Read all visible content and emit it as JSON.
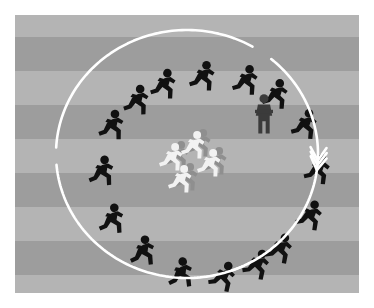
{
  "image": {
    "title": "Group of pictogram runners circling a small inner group",
    "canvas": {
      "width": 374,
      "height": 308,
      "background": "#ffffff"
    },
    "field": {
      "x": 15,
      "y": 15,
      "width": 344,
      "height": 278
    }
  },
  "colors": {
    "page_background": "#ffffff",
    "stripe_light": "#b4b4b4",
    "stripe_dark": "#9d9d9d",
    "runner_outer": "#111111",
    "observer": "#3b3b3b",
    "runner_inner": "#f2f2f2",
    "inner_shadow": "#8f8f8f",
    "arrow": "#ffffff"
  },
  "background": {
    "name": "horizontal-stripe-bands",
    "stripe_height": 34,
    "bands": [
      {
        "top": 0,
        "height": 22,
        "tone": "light"
      },
      {
        "top": 22,
        "height": 34,
        "tone": "dark"
      },
      {
        "top": 56,
        "height": 34,
        "tone": "light"
      },
      {
        "top": 90,
        "height": 34,
        "tone": "dark"
      },
      {
        "top": 124,
        "height": 34,
        "tone": "light"
      },
      {
        "top": 158,
        "height": 34,
        "tone": "dark"
      },
      {
        "top": 192,
        "height": 34,
        "tone": "light"
      },
      {
        "top": 226,
        "height": 34,
        "tone": "dark"
      },
      {
        "top": 260,
        "height": 18,
        "tone": "light"
      }
    ]
  },
  "circle": {
    "name": "rotation-ring",
    "center_x": 172,
    "center_y": 139,
    "radius_x": 131,
    "radius_y": 124,
    "stroke_width": 2.6,
    "arrow_count": 3,
    "arrow_directions": [
      "down-right",
      "up",
      "left"
    ]
  },
  "outer_runners": {
    "count": 16,
    "label": "black-running-pictogram",
    "items": [
      {
        "id": 1,
        "x": 131,
        "y": 52,
        "scale": 1.0,
        "flip": false,
        "rotate": -6
      },
      {
        "id": 2,
        "x": 170,
        "y": 44,
        "scale": 1.0,
        "flip": false,
        "rotate": 0
      },
      {
        "id": 3,
        "x": 104,
        "y": 68,
        "scale": 1.0,
        "flip": false,
        "rotate": -18
      },
      {
        "id": 4,
        "x": 213,
        "y": 48,
        "scale": 1.0,
        "flip": false,
        "rotate": 4
      },
      {
        "id": 5,
        "x": 79,
        "y": 93,
        "scale": 1.0,
        "flip": false,
        "rotate": -28
      },
      {
        "id": 6,
        "x": 243,
        "y": 62,
        "scale": 1.0,
        "flip": false,
        "rotate": 14
      },
      {
        "id": 7,
        "x": 272,
        "y": 92,
        "scale": 1.0,
        "flip": false,
        "rotate": 26
      },
      {
        "id": 8,
        "x": 69,
        "y": 139,
        "scale": 1.0,
        "flip": false,
        "rotate": -48
      },
      {
        "id": 9,
        "x": 285,
        "y": 137,
        "scale": 1.0,
        "flip": false,
        "rotate": 42
      },
      {
        "id": 10,
        "x": 79,
        "y": 187,
        "scale": 1.0,
        "flip": false,
        "rotate": -62
      },
      {
        "id": 11,
        "x": 277,
        "y": 183,
        "scale": 1.0,
        "flip": false,
        "rotate": 60
      },
      {
        "id": 12,
        "x": 110,
        "y": 219,
        "scale": 1.0,
        "flip": false,
        "rotate": -78
      },
      {
        "id": 13,
        "x": 247,
        "y": 216,
        "scale": 1.0,
        "flip": false,
        "rotate": 76
      },
      {
        "id": 14,
        "x": 148,
        "y": 241,
        "scale": 1.0,
        "flip": false,
        "rotate": -92
      },
      {
        "id": 15,
        "x": 190,
        "y": 244,
        "scale": 1.0,
        "flip": false,
        "rotate": 96
      },
      {
        "id": 16,
        "x": 224,
        "y": 232,
        "scale": 1.0,
        "flip": false,
        "rotate": 88
      }
    ]
  },
  "observer": {
    "label": "standing-figure-arms-crossed",
    "x": 236,
    "y": 79,
    "scale": 1.05,
    "color": "#3b3b3b"
  },
  "inner_runners": {
    "count": 4,
    "label": "white-running-pictogram",
    "items": [
      {
        "id": 1,
        "x": 161,
        "y": 113,
        "scale": 0.92,
        "rotate": 0
      },
      {
        "id": 2,
        "x": 139,
        "y": 125,
        "scale": 0.92,
        "rotate": 0
      },
      {
        "id": 3,
        "x": 177,
        "y": 131,
        "scale": 0.92,
        "rotate": 0
      },
      {
        "id": 4,
        "x": 148,
        "y": 147,
        "scale": 0.92,
        "rotate": 0
      }
    ]
  }
}
